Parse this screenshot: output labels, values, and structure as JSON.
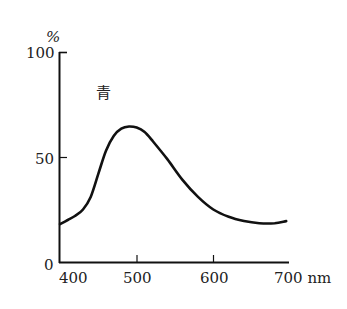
{
  "chart_data": {
    "type": "line",
    "title": "",
    "annotation": "青",
    "xlabel": "nm",
    "ylabel": "%",
    "xlim": [
      400,
      700
    ],
    "ylim": [
      0,
      100
    ],
    "x_ticks": [
      "400",
      "500",
      "600",
      "700 nm"
    ],
    "y_ticks": [
      "0",
      "50",
      "100"
    ],
    "grid": false,
    "legend": null,
    "series": [
      {
        "name": "青",
        "x": [
          400,
          410,
          420,
          430,
          440,
          450,
          460,
          470,
          480,
          490,
          500,
          510,
          520,
          540,
          560,
          580,
          600,
          620,
          640,
          660,
          680,
          695
        ],
        "y": [
          18,
          20,
          22,
          25,
          31,
          42,
          53,
          60,
          63.5,
          64.5,
          64,
          62,
          58,
          49,
          39,
          31,
          25,
          21.5,
          19.5,
          18.5,
          18.5,
          19.5
        ]
      }
    ]
  },
  "axes": {
    "y_unit": "%",
    "x_unit_label": "700 nm",
    "annotation_label": "青"
  }
}
